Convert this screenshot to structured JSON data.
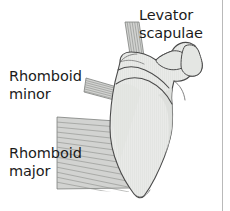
{
  "figure": {
    "background_color": "#ffffff",
    "width": 230,
    "height": 211
  },
  "labels": {
    "levator_scapulae": "Levator\nscapulae",
    "rhomboid_minor": "Rhomboid\nminor",
    "rhomboid_major": "Rhomboid\nmajor"
  },
  "colors": {
    "text": "#1b1b1b",
    "bone_fill": "#e9eae8",
    "bone_outline": "#4a4a4a",
    "bone_shading": "#d6d8d5",
    "muscle_fill": "#d2d3d1",
    "muscle_fiber_line": "#8d8f8c",
    "muscle_outline": "#6f716e",
    "frame_line": "#b9b9b9"
  },
  "structures": [
    {
      "name": "scapula",
      "kind": "bone",
      "label": null,
      "features": [
        "scapular spine",
        "acromion",
        "coracoid process",
        "superior angle",
        "medial border",
        "inferior angle",
        "lateral border"
      ]
    },
    {
      "name": "levator-scapulae",
      "kind": "muscle",
      "label": "Levator scapulae",
      "attachment": "superior angle of scapula",
      "fiber_direction": "vertical",
      "fiber_count": 6
    },
    {
      "name": "rhomboid-minor",
      "kind": "muscle",
      "label": "Rhomboid minor",
      "attachment": "medial border at root of scapular spine",
      "fiber_direction": "oblique",
      "fiber_count": 7
    },
    {
      "name": "rhomboid-major",
      "kind": "muscle",
      "label": "Rhomboid major",
      "attachment": "medial border of scapula below the spine",
      "fiber_direction": "oblique horizontal",
      "fiber_count": 13
    }
  ]
}
